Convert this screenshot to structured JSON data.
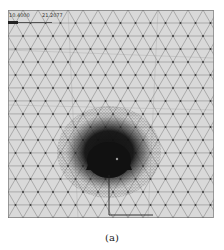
{
  "figure": {
    "caption": "(a)",
    "annotations": {
      "left_label": "10.4000",
      "right_label": "21.2077"
    },
    "mesh": {
      "type": "triangular finite element mesh",
      "line_color": "#8a8a8a",
      "node_color": "#3a3a3a",
      "background": "#d9d9d9",
      "refined_zone_color": "#111111"
    }
  }
}
